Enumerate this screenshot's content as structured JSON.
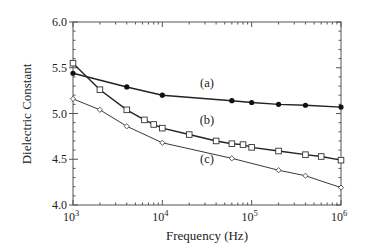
{
  "chart_data": {
    "type": "line",
    "title": "",
    "xlabel": "Frequency (Hz)",
    "ylabel": "Dielectric Constant",
    "xscale": "log",
    "xlim": [
      1000,
      1000000
    ],
    "ylim": [
      4.0,
      6.0
    ],
    "grid": false,
    "legend": "inline labels",
    "x_ticks": [
      {
        "value": 1000,
        "base": "10",
        "exp": "3"
      },
      {
        "value": 10000,
        "base": "10",
        "exp": "4"
      },
      {
        "value": 100000,
        "base": "10",
        "exp": "5"
      },
      {
        "value": 1000000,
        "base": "10",
        "exp": "6"
      }
    ],
    "y_ticks": [
      "4.0",
      "4.5",
      "5.0",
      "5.5",
      "6.0"
    ],
    "series": [
      {
        "name": "(a)",
        "marker": "filled-circle",
        "label_pos": [
          207,
          87
        ],
        "x": [
          1000,
          4000,
          10000,
          60000,
          100000,
          200000,
          400000,
          1000000
        ],
        "values": [
          5.44,
          5.29,
          5.2,
          5.14,
          5.12,
          5.1,
          5.09,
          5.07
        ]
      },
      {
        "name": "(b)",
        "marker": "open-square",
        "label_pos": [
          207,
          124
        ],
        "x": [
          1000,
          2000,
          4000,
          6300,
          8000,
          10000,
          20000,
          40000,
          60000,
          80000,
          100000,
          200000,
          400000,
          600000,
          1000000
        ],
        "values": [
          5.55,
          5.26,
          5.04,
          4.93,
          4.88,
          4.84,
          4.77,
          4.7,
          4.67,
          4.66,
          4.63,
          4.59,
          4.55,
          4.53,
          4.49
        ]
      },
      {
        "name": "(c)",
        "marker": "open-diamond",
        "label_pos": [
          207,
          163
        ],
        "x": [
          1000,
          2000,
          4000,
          10000,
          60000,
          200000,
          400000,
          1000000
        ],
        "values": [
          5.16,
          5.04,
          4.86,
          4.68,
          4.51,
          4.38,
          4.32,
          4.19
        ]
      }
    ]
  }
}
